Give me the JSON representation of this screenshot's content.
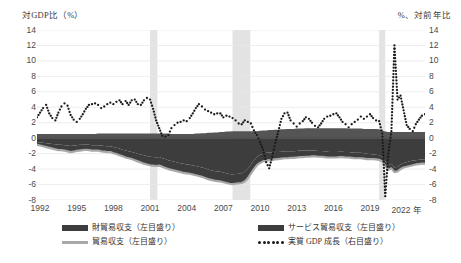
{
  "axes": {
    "left_title": "対GDP比（%）",
    "right_title": "%、対前年比",
    "y_ticks": [
      "14",
      "12",
      "10",
      "8",
      "6",
      "4",
      "2",
      "0",
      "-2",
      "-4",
      "-6",
      "-8"
    ],
    "y_min": -8,
    "y_max": 14,
    "x_ticks": [
      "1992",
      "1995",
      "1998",
      "2001",
      "2004",
      "2007",
      "2010",
      "2013",
      "2016",
      "2019",
      "2022 年"
    ]
  },
  "legend": [
    {
      "key": "goods_services",
      "label": "財貿易収支（左目盛り）",
      "marker": "area",
      "color": "#3d3d3d"
    },
    {
      "key": "goods",
      "label": "貿易収支（左目盛り）",
      "marker": "line",
      "color": "#a8a8a8"
    },
    {
      "key": "services",
      "label": "サービス貿易収支（左目盛り）",
      "marker": "area",
      "color": "#555555"
    },
    {
      "key": "gdp",
      "label": "実質 GDP 成長（右目盛り）",
      "marker": "dotted",
      "color": "#1a1a1a"
    }
  ],
  "colors": {
    "area_dark": "#3d3d3d",
    "area_mid": "#555555",
    "line_gray": "#a8a8a8",
    "dots": "#1a1a1a",
    "recession_band": "#e3e3e3",
    "gridline": "#e8e8e8",
    "zero_line": "#4a4a4a"
  },
  "chart_data": {
    "type": "area",
    "title": "",
    "subtitle": "",
    "xlabel": "",
    "ylabel": "対GDP比（%）",
    "y2label": "%、対前年比",
    "ylim": [
      -8,
      14
    ],
    "y2lim": [
      -8,
      14
    ],
    "grid": true,
    "legend_position": "bottom",
    "x_start": 1992.0,
    "x_end": 2023.75,
    "x_step": 0.25,
    "recessions": [
      {
        "start": 2001.25,
        "end": 2001.85
      },
      {
        "start": 2008.0,
        "end": 2009.45
      },
      {
        "start": 2020.0,
        "end": 2020.5
      }
    ],
    "series": [
      {
        "name": "貿易収支（左目盛り）",
        "unit": "対GDP比（%）",
        "axis": "left",
        "render": "line",
        "values": [
          -0.85,
          -0.95,
          -1.05,
          -1.15,
          -1.25,
          -1.35,
          -1.45,
          -1.55,
          -1.55,
          -1.6,
          -1.7,
          -1.8,
          -1.75,
          -1.65,
          -1.6,
          -1.55,
          -1.5,
          -1.55,
          -1.6,
          -1.6,
          -1.6,
          -1.7,
          -1.75,
          -1.8,
          -1.8,
          -1.95,
          -2.05,
          -2.2,
          -2.35,
          -2.5,
          -2.6,
          -2.7,
          -2.85,
          -3.0,
          -3.15,
          -3.3,
          -3.4,
          -3.5,
          -3.55,
          -3.6,
          -3.55,
          -3.7,
          -3.85,
          -4.0,
          -4.1,
          -4.2,
          -4.3,
          -4.4,
          -4.5,
          -4.55,
          -4.6,
          -4.7,
          -4.8,
          -4.9,
          -5.0,
          -5.15,
          -5.3,
          -5.4,
          -5.5,
          -5.55,
          -5.6,
          -5.7,
          -5.8,
          -5.9,
          -5.95,
          -5.9,
          -5.85,
          -5.8,
          -5.6,
          -5.2,
          -4.6,
          -4.0,
          -3.5,
          -3.2,
          -3.0,
          -2.9,
          -2.85,
          -2.8,
          -2.75,
          -2.7,
          -2.65,
          -2.6,
          -2.6,
          -2.55,
          -2.55,
          -2.5,
          -2.45,
          -2.45,
          -2.4,
          -2.4,
          -2.35,
          -2.35,
          -2.4,
          -2.4,
          -2.45,
          -2.5,
          -2.5,
          -2.5,
          -2.5,
          -2.45,
          -2.45,
          -2.5,
          -2.5,
          -2.55,
          -2.6,
          -2.6,
          -2.6,
          -2.65,
          -2.7,
          -2.7,
          -2.7,
          -2.75,
          -2.8,
          -3.0,
          -3.6,
          -4.1,
          -3.9,
          -4.4,
          -4.3,
          -4.0,
          -3.8,
          -3.7,
          -3.6,
          -3.5,
          -3.4,
          -3.35,
          -3.3,
          -3.3
        ]
      },
      {
        "name": "財貿易収支（左目盛り）",
        "unit": "対GDP比（%）",
        "axis": "left",
        "render": "area",
        "note": "合計（財＋サービス）バンドの下端",
        "values": [
          -0.5,
          -0.55,
          -0.6,
          -0.65,
          -0.7,
          -0.75,
          -0.8,
          -0.85,
          -0.85,
          -0.9,
          -0.95,
          -1.0,
          -0.95,
          -0.9,
          -0.85,
          -0.85,
          -0.8,
          -0.85,
          -0.9,
          -0.9,
          -0.9,
          -0.95,
          -1.0,
          -1.05,
          -1.05,
          -1.15,
          -1.25,
          -1.35,
          -1.5,
          -1.6,
          -1.7,
          -1.8,
          -1.9,
          -2.0,
          -2.1,
          -2.2,
          -2.3,
          -2.4,
          -2.45,
          -2.5,
          -2.45,
          -2.6,
          -2.7,
          -2.85,
          -2.95,
          -3.05,
          -3.15,
          -3.25,
          -3.3,
          -3.4,
          -3.45,
          -3.55,
          -3.6,
          -3.7,
          -3.8,
          -3.9,
          -4.05,
          -4.15,
          -4.25,
          -4.3,
          -4.35,
          -4.45,
          -4.55,
          -4.65,
          -4.7,
          -4.65,
          -4.6,
          -4.55,
          -4.35,
          -3.95,
          -3.4,
          -2.85,
          -2.4,
          -2.15,
          -2.0,
          -1.9,
          -1.85,
          -1.85,
          -1.8,
          -1.8,
          -1.75,
          -1.7,
          -1.7,
          -1.7,
          -1.7,
          -1.65,
          -1.6,
          -1.6,
          -1.6,
          -1.6,
          -1.6,
          -1.6,
          -1.65,
          -1.65,
          -1.7,
          -1.75,
          -1.8,
          -1.8,
          -1.8,
          -1.75,
          -1.75,
          -1.8,
          -1.8,
          -1.85,
          -1.9,
          -1.9,
          -1.9,
          -1.95,
          -2.0,
          -2.05,
          -2.1,
          -2.15,
          -2.2,
          -2.4,
          -3.0,
          -3.5,
          -3.3,
          -3.8,
          -3.7,
          -3.4,
          -3.2,
          -3.1,
          -3.0,
          -2.9,
          -2.85,
          -2.8,
          -2.75,
          -2.75
        ]
      },
      {
        "name": "サービス貿易収支（左目盛り）",
        "unit": "対GDP比（%）",
        "axis": "left",
        "render": "area",
        "note": "ゼロ線上の薄いバンド上端（プラス寄与）",
        "values": [
          0.55,
          0.55,
          0.55,
          0.55,
          0.55,
          0.55,
          0.55,
          0.55,
          0.55,
          0.55,
          0.55,
          0.55,
          0.55,
          0.55,
          0.55,
          0.55,
          0.55,
          0.55,
          0.55,
          0.55,
          0.6,
          0.6,
          0.6,
          0.6,
          0.6,
          0.6,
          0.6,
          0.6,
          0.6,
          0.6,
          0.6,
          0.6,
          0.6,
          0.6,
          0.6,
          0.6,
          0.6,
          0.6,
          0.6,
          0.6,
          0.6,
          0.6,
          0.6,
          0.6,
          0.55,
          0.55,
          0.55,
          0.55,
          0.55,
          0.55,
          0.55,
          0.55,
          0.6,
          0.6,
          0.65,
          0.65,
          0.7,
          0.7,
          0.75,
          0.75,
          0.8,
          0.8,
          0.85,
          0.85,
          0.9,
          0.9,
          0.9,
          0.9,
          0.9,
          0.9,
          0.9,
          0.9,
          0.9,
          0.95,
          1.0,
          1.0,
          1.05,
          1.05,
          1.1,
          1.1,
          1.15,
          1.15,
          1.2,
          1.2,
          1.2,
          1.25,
          1.25,
          1.25,
          1.3,
          1.3,
          1.3,
          1.3,
          1.3,
          1.3,
          1.3,
          1.3,
          1.3,
          1.3,
          1.3,
          1.3,
          1.3,
          1.3,
          1.25,
          1.25,
          1.25,
          1.25,
          1.25,
          1.2,
          1.2,
          1.2,
          1.2,
          1.2,
          1.15,
          1.0,
          0.85,
          0.8,
          0.8,
          0.8,
          0.8,
          0.8,
          0.8,
          0.8,
          0.8,
          0.8,
          0.8,
          0.8,
          0.8,
          0.8
        ]
      },
      {
        "name": "実質 GDP 成長（右目盛り）",
        "unit": "%、対前年比",
        "axis": "right",
        "render": "dotted",
        "values": [
          2.7,
          3.3,
          3.9,
          4.3,
          3.2,
          2.6,
          2.3,
          3.3,
          4.1,
          4.5,
          4.2,
          3.0,
          2.4,
          2.1,
          2.5,
          3.1,
          3.8,
          4.3,
          4.4,
          4.5,
          4.3,
          3.9,
          4.1,
          4.4,
          4.6,
          4.4,
          4.7,
          4.9,
          4.4,
          4.8,
          4.3,
          4.9,
          5.0,
          4.4,
          4.3,
          4.9,
          5.2,
          5.0,
          3.8,
          2.3,
          1.3,
          0.3,
          0.2,
          0.4,
          1.3,
          1.7,
          2.0,
          2.1,
          2.3,
          2.2,
          2.6,
          3.2,
          3.9,
          4.4,
          4.1,
          3.7,
          3.5,
          3.3,
          3.1,
          3.2,
          3.2,
          2.7,
          2.9,
          2.8,
          2.6,
          2.3,
          1.9,
          1.8,
          2.3,
          2.1,
          1.9,
          1.0,
          0.4,
          -0.5,
          -1.5,
          -3.1,
          -3.9,
          -2.4,
          -0.6,
          0.9,
          2.5,
          3.2,
          3.3,
          2.3,
          1.9,
          1.5,
          1.9,
          2.2,
          2.7,
          2.5,
          2.0,
          1.6,
          1.4,
          1.9,
          2.5,
          2.8,
          2.9,
          3.1,
          3.2,
          2.7,
          2.1,
          1.8,
          1.4,
          1.8,
          2.1,
          2.4,
          2.8,
          2.5,
          2.8,
          3.1,
          2.6,
          2.3,
          2.2,
          0.6,
          -7.5,
          -2.0,
          0.9,
          12.0,
          5.0,
          5.5,
          3.6,
          1.7,
          1.2,
          0.9,
          1.8,
          2.4,
          2.9,
          3.1
        ]
      }
    ]
  }
}
